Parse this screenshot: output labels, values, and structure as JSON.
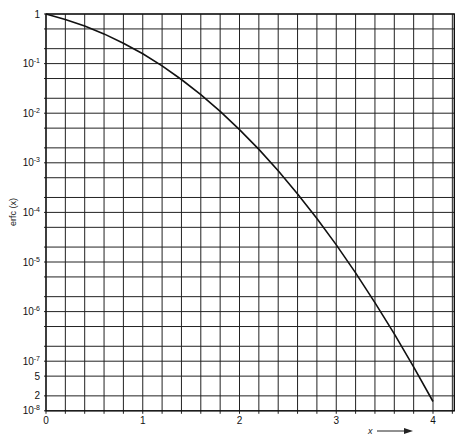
{
  "chart_data": {
    "type": "line",
    "title": "",
    "xlabel": "x",
    "ylabel": "erfc (x)",
    "xscale": "linear",
    "yscale": "log",
    "xlim": [
      0,
      4.2
    ],
    "ylim": [
      1e-08,
      1
    ],
    "grid": true,
    "x_grid_step": 0.2,
    "y_grid_per_decade": [
      1,
      0.5,
      0.2
    ],
    "x_ticks": [
      {
        "value": 0,
        "label": "0"
      },
      {
        "value": 1,
        "label": "1"
      },
      {
        "value": 2,
        "label": "2"
      },
      {
        "value": 3,
        "label": "3"
      },
      {
        "value": 4,
        "label": "4"
      }
    ],
    "y_ticks": [
      {
        "value": 1,
        "base": "1",
        "exp": ""
      },
      {
        "value": 0.1,
        "base": "10",
        "exp": "-1"
      },
      {
        "value": 0.01,
        "base": "10",
        "exp": "-2"
      },
      {
        "value": 0.001,
        "base": "10",
        "exp": "-3"
      },
      {
        "value": 0.0001,
        "base": "10",
        "exp": "-4"
      },
      {
        "value": 1e-05,
        "base": "10",
        "exp": "-5"
      },
      {
        "value": 1e-06,
        "base": "10",
        "exp": "-6"
      },
      {
        "value": 1e-07,
        "base": "10",
        "exp": "-7"
      },
      {
        "value": 5e-08,
        "base": "5",
        "exp": ""
      },
      {
        "value": 2e-08,
        "base": "2",
        "exp": ""
      },
      {
        "value": 1e-08,
        "base": "10",
        "exp": "-8"
      }
    ],
    "series": [
      {
        "name": "erfc(x)",
        "x": [
          0,
          0.2,
          0.4,
          0.6,
          0.8,
          1.0,
          1.2,
          1.4,
          1.6,
          1.8,
          2.0,
          2.2,
          2.4,
          2.6,
          2.8,
          3.0,
          3.2,
          3.4,
          3.6,
          3.8,
          4.0
        ],
        "y": [
          1,
          0.7773,
          0.5716,
          0.3961,
          0.2579,
          0.1573,
          0.08969,
          0.04771,
          0.02365,
          0.01091,
          0.004678,
          0.001863,
          0.0006885,
          0.000236,
          7.501e-05,
          2.209e-05,
          6.026e-06,
          1.522e-06,
          3.558e-07,
          7.7e-08,
          1.542e-08
        ]
      }
    ]
  }
}
